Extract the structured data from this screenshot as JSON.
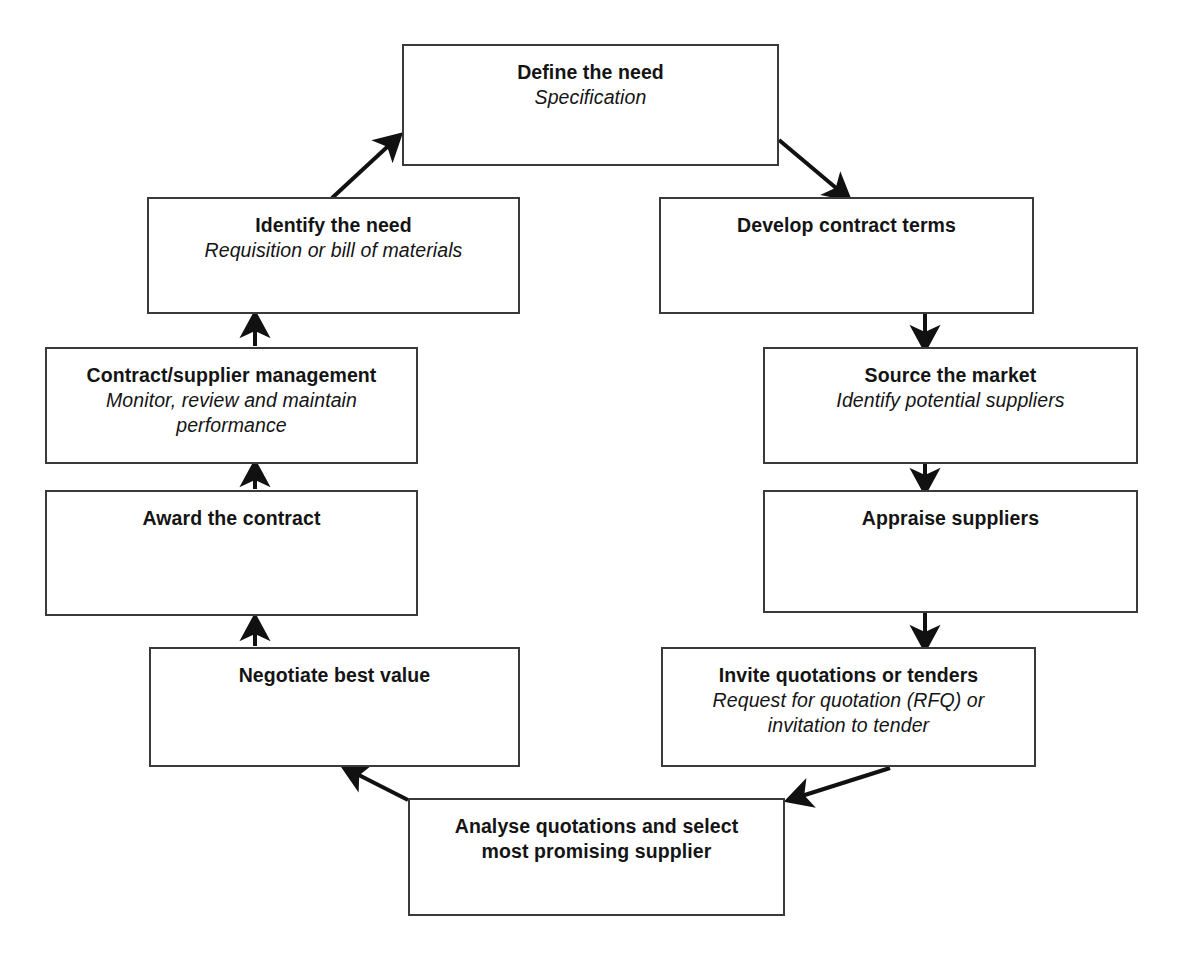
{
  "diagram": {
    "name": "The procurement cycle",
    "top_cut_text": "",
    "line_color": "#3a3a3a",
    "arrow_color": "#111111",
    "background": "#ffffff",
    "nodes": [
      {
        "id": "define-the-need",
        "title": "Define the need",
        "subtitle": "Specification",
        "x": 402,
        "y": 44,
        "w": 377,
        "h": 122
      },
      {
        "id": "identify-the-need",
        "title": "Identify the need",
        "subtitle": "Requisition or bill of materials",
        "x": 147,
        "y": 197,
        "w": 373,
        "h": 117
      },
      {
        "id": "develop-contract-terms",
        "title": "Develop contract terms",
        "subtitle": "",
        "x": 659,
        "y": 197,
        "w": 375,
        "h": 117
      },
      {
        "id": "contract-supplier-management",
        "title": "Contract/supplier management",
        "subtitle": "Monitor, review and maintain performance",
        "x": 45,
        "y": 347,
        "w": 373,
        "h": 117
      },
      {
        "id": "source-the-market",
        "title": "Source the market",
        "subtitle": "Identify potential suppliers",
        "x": 763,
        "y": 347,
        "w": 375,
        "h": 117
      },
      {
        "id": "award-the-contract",
        "title": "Award the contract",
        "subtitle": "",
        "x": 45,
        "y": 490,
        "w": 373,
        "h": 126
      },
      {
        "id": "appraise-suppliers",
        "title": "Appraise suppliers",
        "subtitle": "",
        "x": 763,
        "y": 490,
        "w": 375,
        "h": 123
      },
      {
        "id": "negotiate-best-value",
        "title": "Negotiate best value",
        "subtitle": "",
        "x": 149,
        "y": 647,
        "w": 371,
        "h": 120
      },
      {
        "id": "invite-quotations-or-tenders",
        "title": "Invite quotations or tenders",
        "subtitle": "Request for quotation (RFQ) or invitation to tender",
        "x": 661,
        "y": 647,
        "w": 375,
        "h": 120
      },
      {
        "id": "analyse-quotations",
        "title": "Analyse quotations and select most promising supplier",
        "subtitle": "",
        "x": 408,
        "y": 798,
        "w": 377,
        "h": 118
      }
    ],
    "connectors": [
      {
        "id": "identify-to-define",
        "from": "identify-the-need",
        "to": "define-the-need",
        "direction": "up-right"
      },
      {
        "id": "define-to-develop",
        "from": "define-the-need",
        "to": "develop-contract-terms",
        "direction": "down-right"
      },
      {
        "id": "develop-to-source",
        "from": "develop-contract-terms",
        "to": "source-the-market",
        "direction": "down"
      },
      {
        "id": "source-to-appraise",
        "from": "source-the-market",
        "to": "appraise-suppliers",
        "direction": "down"
      },
      {
        "id": "appraise-to-invite",
        "from": "appraise-suppliers",
        "to": "invite-quotations-or-tenders",
        "direction": "down"
      },
      {
        "id": "invite-to-analyse",
        "from": "invite-quotations-or-tenders",
        "to": "analyse-quotations",
        "direction": "down-left"
      },
      {
        "id": "analyse-to-negotiate",
        "from": "analyse-quotations",
        "to": "negotiate-best-value",
        "direction": "up-left"
      },
      {
        "id": "negotiate-to-award",
        "from": "negotiate-best-value",
        "to": "award-the-contract",
        "direction": "up"
      },
      {
        "id": "award-to-contract-management",
        "from": "award-the-contract",
        "to": "contract-supplier-management",
        "direction": "up"
      },
      {
        "id": "management-to-identify",
        "from": "contract-supplier-management",
        "to": "identify-the-need",
        "direction": "up"
      }
    ]
  }
}
